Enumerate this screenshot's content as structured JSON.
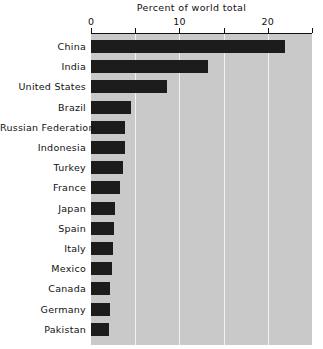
{
  "chart_data": {
    "type": "bar",
    "orientation": "horizontal",
    "title": "Percent of world total",
    "xlabel": "",
    "ylabel": "",
    "xlim": [
      0,
      25
    ],
    "ylim": null,
    "grid": true,
    "legend": null,
    "legend_position": "none",
    "xticks": [
      0,
      5,
      10,
      15,
      20,
      25
    ],
    "xtick_labels": [
      "0",
      "",
      "10",
      "",
      "20",
      ""
    ],
    "categories": [
      "China",
      "India",
      "United States",
      "Brazil",
      "Russian Federation",
      "Indonesia",
      "Turkey",
      "France",
      "Japan",
      "Spain",
      "Italy",
      "Mexico",
      "Canada",
      "Germany",
      "Pakistan"
    ],
    "values": [
      21.9,
      13.2,
      8.6,
      4.5,
      3.8,
      3.9,
      3.6,
      3.3,
      2.7,
      2.6,
      2.5,
      2.4,
      2.2,
      2.1,
      2.0
    ],
    "colors": {
      "bar": "#1c1c1c",
      "plot_background": "#c9c9c9",
      "grid": "#f2f2f2",
      "axis": "#111111",
      "figure_background": "#ffffff",
      "text": "#111111"
    }
  }
}
